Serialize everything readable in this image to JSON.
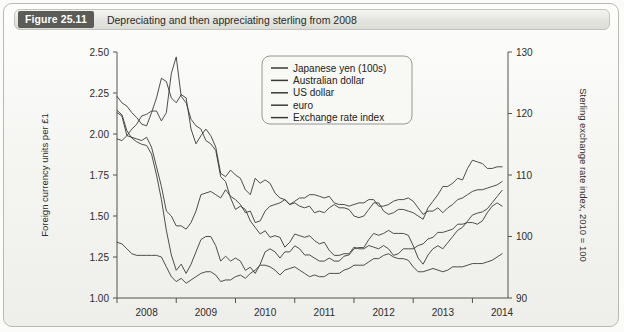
{
  "figure": {
    "badge_label": "Figure 25.11",
    "caption": "Depreciating and then appreciating sterling from 2008",
    "badge_color": "#5b5b58",
    "frame_color": "#b9b9b4",
    "line_color": "#3a3a38"
  },
  "chart_data": {
    "type": "line",
    "title": "Depreciating and then appreciating sterling from 2008",
    "xlabel": "",
    "ylabel": "Foreign currency units per £1",
    "ylabel_right": "Sterling exchange rate index, 2010 = 100",
    "grid": false,
    "legend_position": "upper-center",
    "xlim": [
      2008.0,
      2014.6
    ],
    "ylim": [
      1.0,
      2.5
    ],
    "ylim_right": [
      90,
      130
    ],
    "xticks": [
      2008,
      2009,
      2010,
      2011,
      2012,
      2013,
      2014
    ],
    "xtick_labels": [
      "2008",
      "2009",
      "2010",
      "2011",
      "2012",
      "2013",
      "2014"
    ],
    "yticks": [
      1.0,
      1.25,
      1.5,
      1.75,
      2.0,
      2.25,
      2.5
    ],
    "ytick_labels": [
      "1.00",
      "1.25",
      "1.50",
      "1.75",
      "2.00",
      "2.25",
      "2.50"
    ],
    "yticks_right": [
      90,
      100,
      110,
      120,
      130
    ],
    "ytick_labels_right": [
      "90",
      "100",
      "110",
      "120",
      "130"
    ],
    "x": [
      2008.0,
      2008.083,
      2008.167,
      2008.25,
      2008.333,
      2008.417,
      2008.5,
      2008.583,
      2008.667,
      2008.75,
      2008.833,
      2008.917,
      2009.0,
      2009.083,
      2009.167,
      2009.25,
      2009.333,
      2009.417,
      2009.5,
      2009.583,
      2009.667,
      2009.75,
      2009.833,
      2009.917,
      2010.0,
      2010.083,
      2010.167,
      2010.25,
      2010.333,
      2010.417,
      2010.5,
      2010.583,
      2010.667,
      2010.75,
      2010.833,
      2010.917,
      2011.0,
      2011.083,
      2011.167,
      2011.25,
      2011.333,
      2011.417,
      2011.5,
      2011.583,
      2011.667,
      2011.75,
      2011.833,
      2011.917,
      2012.0,
      2012.083,
      2012.167,
      2012.25,
      2012.333,
      2012.417,
      2012.5,
      2012.583,
      2012.667,
      2012.75,
      2012.833,
      2012.917,
      2013.0,
      2013.083,
      2013.167,
      2013.25,
      2013.333,
      2013.417,
      2013.5,
      2013.583,
      2013.667,
      2013.75,
      2013.833,
      2013.917,
      2014.0,
      2014.083,
      2014.167,
      2014.25,
      2014.333,
      2014.417,
      2014.5
    ],
    "series": [
      {
        "name": "Japanese yen (100s)",
        "legend_label": "Japanese yen (100s)",
        "values": [
          2.13,
          2.11,
          1.99,
          2.03,
          2.06,
          2.11,
          2.12,
          2.14,
          2.14,
          2.08,
          2.13,
          2.37,
          2.47,
          2.23,
          2.19,
          2.09,
          2.05,
          2.03,
          1.96,
          1.94,
          1.9,
          1.74,
          1.71,
          1.61,
          1.54,
          1.56,
          1.54,
          1.47,
          1.43,
          1.39,
          1.41,
          1.37,
          1.38,
          1.37,
          1.31,
          1.34,
          1.39,
          1.38,
          1.37,
          1.38,
          1.35,
          1.33,
          1.34,
          1.29,
          1.26,
          1.26,
          1.27,
          1.27,
          1.31,
          1.3,
          1.3,
          1.32,
          1.31,
          1.3,
          1.32,
          1.3,
          1.26,
          1.27,
          1.3,
          1.3,
          1.3,
          1.32,
          1.33,
          1.36,
          1.37,
          1.4,
          1.4,
          1.41,
          1.42,
          1.45,
          1.45,
          1.46,
          1.46,
          1.45,
          1.47,
          1.52,
          1.56,
          1.58,
          1.56
        ]
      },
      {
        "name": "Australian dollar",
        "legend_label": "Australian dollar",
        "values": [
          2.23,
          2.19,
          2.17,
          2.13,
          2.1,
          2.06,
          2.05,
          2.13,
          2.22,
          2.34,
          2.32,
          2.22,
          2.19,
          2.24,
          2.22,
          2.03,
          1.94,
          1.99,
          2.03,
          1.99,
          1.92,
          1.76,
          1.74,
          1.78,
          1.75,
          1.73,
          1.66,
          1.63,
          1.73,
          1.7,
          1.72,
          1.7,
          1.64,
          1.61,
          1.6,
          1.57,
          1.58,
          1.56,
          1.55,
          1.56,
          1.52,
          1.53,
          1.52,
          1.55,
          1.57,
          1.55,
          1.55,
          1.54,
          1.5,
          1.49,
          1.5,
          1.54,
          1.58,
          1.58,
          1.53,
          1.51,
          1.52,
          1.54,
          1.54,
          1.53,
          1.52,
          1.5,
          1.48,
          1.55,
          1.59,
          1.63,
          1.68,
          1.68,
          1.7,
          1.73,
          1.72,
          1.79,
          1.84,
          1.83,
          1.82,
          1.79,
          1.79,
          1.8,
          1.8
        ]
      },
      {
        "name": "US dollar",
        "legend_label": "US dollar",
        "values": [
          1.97,
          1.96,
          1.99,
          1.98,
          1.97,
          1.96,
          1.98,
          1.92,
          1.8,
          1.68,
          1.53,
          1.5,
          1.44,
          1.44,
          1.42,
          1.46,
          1.53,
          1.63,
          1.64,
          1.65,
          1.63,
          1.61,
          1.66,
          1.62,
          1.6,
          1.57,
          1.52,
          1.53,
          1.46,
          1.47,
          1.53,
          1.56,
          1.57,
          1.58,
          1.6,
          1.57,
          1.59,
          1.61,
          1.61,
          1.63,
          1.63,
          1.62,
          1.61,
          1.62,
          1.58,
          1.57,
          1.57,
          1.56,
          1.57,
          1.58,
          1.58,
          1.6,
          1.6,
          1.56,
          1.56,
          1.57,
          1.59,
          1.6,
          1.6,
          1.61,
          1.59,
          1.55,
          1.51,
          1.53,
          1.53,
          1.55,
          1.52,
          1.55,
          1.57,
          1.6,
          1.61,
          1.63,
          1.65,
          1.66,
          1.66,
          1.67,
          1.68,
          1.69,
          1.71
        ]
      },
      {
        "name": "euro",
        "legend_label": "euro",
        "values": [
          1.34,
          1.33,
          1.3,
          1.27,
          1.26,
          1.26,
          1.26,
          1.26,
          1.26,
          1.25,
          1.19,
          1.13,
          1.1,
          1.12,
          1.09,
          1.11,
          1.13,
          1.15,
          1.16,
          1.16,
          1.14,
          1.1,
          1.11,
          1.11,
          1.13,
          1.14,
          1.12,
          1.15,
          1.17,
          1.2,
          1.2,
          1.19,
          1.17,
          1.14,
          1.17,
          1.18,
          1.19,
          1.17,
          1.15,
          1.13,
          1.14,
          1.13,
          1.13,
          1.15,
          1.15,
          1.15,
          1.17,
          1.18,
          1.2,
          1.2,
          1.2,
          1.22,
          1.24,
          1.24,
          1.26,
          1.27,
          1.25,
          1.24,
          1.24,
          1.23,
          1.19,
          1.16,
          1.16,
          1.17,
          1.18,
          1.17,
          1.16,
          1.17,
          1.19,
          1.19,
          1.19,
          1.2,
          1.21,
          1.21,
          1.21,
          1.22,
          1.23,
          1.25,
          1.27
        ]
      },
      {
        "name": "Exchange rate index",
        "legend_label": "Exchange rate index",
        "axis": "right",
        "values": [
          120.5,
          119.8,
          117.2,
          116.0,
          115.4,
          115.0,
          114.8,
          113.4,
          110.0,
          106.0,
          101.0,
          97.0,
          94.5,
          95.5,
          94.0,
          95.5,
          97.5,
          99.5,
          100.0,
          100.0,
          98.5,
          96.0,
          96.8,
          96.0,
          96.5,
          96.0,
          94.5,
          95.0,
          94.0,
          95.5,
          97.5,
          98.0,
          97.5,
          96.5,
          97.5,
          97.5,
          98.5,
          98.0,
          97.0,
          97.0,
          96.5,
          96.0,
          96.0,
          96.5,
          96.0,
          96.0,
          96.8,
          97.0,
          98.0,
          98.2,
          98.2,
          99.5,
          100.5,
          100.2,
          100.5,
          101.0,
          100.5,
          100.5,
          100.5,
          100.2,
          98.5,
          96.5,
          95.5,
          97.0,
          98.0,
          98.5,
          98.0,
          99.0,
          100.0,
          101.0,
          101.5,
          102.5,
          103.5,
          103.8,
          104.0,
          104.5,
          105.5,
          106.5,
          107.5
        ]
      }
    ]
  }
}
